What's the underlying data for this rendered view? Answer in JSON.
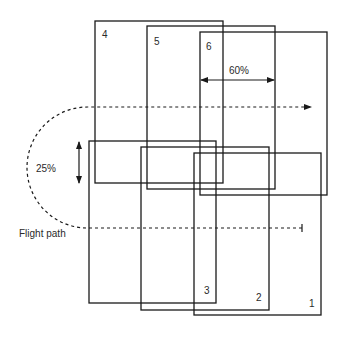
{
  "diagram": {
    "photos": [
      {
        "id": "1",
        "label": "1",
        "x": 194,
        "y": 153,
        "w": 127,
        "h": 162,
        "label_x": 309,
        "label_y": 307
      },
      {
        "id": "2",
        "label": "2",
        "x": 141,
        "y": 147,
        "w": 128,
        "h": 163,
        "label_x": 256,
        "label_y": 301
      },
      {
        "id": "3",
        "label": "3",
        "x": 89,
        "y": 141,
        "w": 127,
        "h": 162,
        "label_x": 204,
        "label_y": 294
      },
      {
        "id": "4",
        "label": "4",
        "x": 95,
        "y": 21,
        "w": 128,
        "h": 162,
        "label_x": 102,
        "label_y": 38
      },
      {
        "id": "5",
        "label": "5",
        "x": 147,
        "y": 26,
        "w": 128,
        "h": 163,
        "label_x": 154,
        "label_y": 45
      },
      {
        "id": "6",
        "label": "6",
        "x": 200,
        "y": 32,
        "w": 127,
        "h": 163,
        "label_x": 206,
        "label_y": 50
      }
    ],
    "forward_overlap": {
      "label": "60%",
      "x1": 201,
      "x2": 274,
      "y": 80,
      "label_x": 229,
      "label_y": 74
    },
    "side_overlap": {
      "label": "25%",
      "x": 79,
      "y1": 142,
      "y2": 183,
      "label_x": 36,
      "label_y": 172
    },
    "flight_path": {
      "label": "Flight path",
      "label_x": 19,
      "label_y": 237,
      "top_y": 107,
      "bottom_y": 228,
      "start_x": 302,
      "end_x": 311,
      "turn_x": 27
    }
  }
}
